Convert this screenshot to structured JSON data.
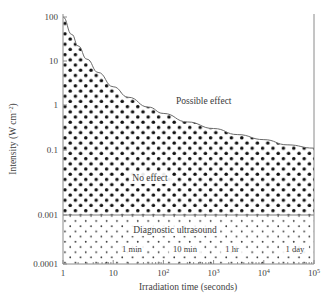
{
  "chart_data": {
    "type": "area",
    "title": "",
    "xlabel": "Irradiation time (seconds)",
    "ylabel": "Intensity (W cm−2)",
    "ylabel_parts": {
      "base": "Intensity (W cm",
      "exponent": "−2",
      "tail": ")"
    },
    "xscale": "log",
    "yscale": "log",
    "xlim": [
      1,
      100000
    ],
    "ylim": [
      0.0001,
      100
    ],
    "grid": false,
    "legend": "none",
    "x_ticks": [
      {
        "value": 1,
        "label": "1",
        "mantissa": "1",
        "exponent": ""
      },
      {
        "value": 10,
        "label": "10",
        "mantissa": "10",
        "exponent": ""
      },
      {
        "value": 100,
        "label": "10²",
        "mantissa": "10",
        "exponent": "2"
      },
      {
        "value": 1000,
        "label": "10³",
        "mantissa": "10",
        "exponent": "3"
      },
      {
        "value": 10000,
        "label": "10⁴",
        "mantissa": "10",
        "exponent": "4"
      },
      {
        "value": 100000,
        "label": "10⁵",
        "mantissa": "10",
        "exponent": "5"
      }
    ],
    "y_ticks": [
      {
        "value": 100,
        "label": "100",
        "y_px": 17
      },
      {
        "value": 10,
        "label": "10",
        "y_px": 61
      },
      {
        "value": 1,
        "label": "1",
        "y_px": 105
      },
      {
        "value": 0.1,
        "label": "0.1",
        "y_px": 150
      },
      {
        "value": 0.001,
        "label": "0.001",
        "y_px": 215
      },
      {
        "value": 0.0001,
        "label": "0.0001",
        "y_px": 264
      }
    ],
    "threshold_curve": {
      "name": "Threshold for possible bioeffect",
      "description": "Boundary between 'No effect' (below) and 'Possible effect' (above); approximately constant intensity-time product",
      "points": [
        {
          "t": 1,
          "I": 100
        },
        {
          "t": 1.5,
          "I": 40
        },
        {
          "t": 2,
          "I": 22
        },
        {
          "t": 3,
          "I": 11
        },
        {
          "t": 5,
          "I": 5.5
        },
        {
          "t": 10,
          "I": 2.6
        },
        {
          "t": 20,
          "I": 1.5
        },
        {
          "t": 50,
          "I": 0.9
        },
        {
          "t": 100,
          "I": 0.65
        },
        {
          "t": 300,
          "I": 0.42
        },
        {
          "t": 1000,
          "I": 0.3
        },
        {
          "t": 3000,
          "I": 0.22
        },
        {
          "t": 10000,
          "I": 0.17
        },
        {
          "t": 30000,
          "I": 0.13
        },
        {
          "t": 100000,
          "I": 0.11
        }
      ]
    },
    "divider_level": {
      "value": 0.001,
      "label": "0.001"
    },
    "regions": [
      {
        "name": "possible-effect",
        "label": "Possible effect",
        "fill": "white",
        "label_pos": {
          "t": 800,
          "I": 1.6
        }
      },
      {
        "name": "no-effect",
        "label": "No effect",
        "fill": "dense-dot-stipple",
        "label_pos": {
          "t": 90,
          "I": 0.06
        }
      },
      {
        "name": "diagnostic-ultrasound",
        "label": "Diagnostic ultrasound",
        "fill": "sparse-dot-stipple",
        "label_pos": {
          "t": 130,
          "I": 0.0006
        }
      }
    ],
    "time_markers": [
      {
        "label": "1 min",
        "seconds": 60,
        "x_px": 132
      },
      {
        "label": "10 min",
        "seconds": 600,
        "x_px": 185
      },
      {
        "label": "1 hr",
        "seconds": 3600,
        "x_px": 232
      },
      {
        "label": "1 day",
        "seconds": 86400,
        "x_px": 295
      }
    ],
    "colors": {
      "axis": "#8a8a8a",
      "curve": "#6b6b6b",
      "text": "#3a3a3a",
      "stipple": "#111111",
      "background": "#ffffff"
    }
  }
}
